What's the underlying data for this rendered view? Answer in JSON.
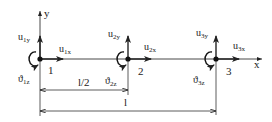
{
  "diagram": {
    "axes": {
      "x_label": "x",
      "y_label": "y"
    },
    "nodes": [
      {
        "id": "1",
        "label": "1",
        "ux": "u",
        "ux_sub": "1x",
        "uy": "u",
        "uy_sub": "1y",
        "rot": "ϑ",
        "rot_sub": "1z"
      },
      {
        "id": "2",
        "label": "2",
        "ux": "u",
        "ux_sub": "2x",
        "uy": "u",
        "uy_sub": "2y",
        "rot": "ϑ",
        "rot_sub": "2z"
      },
      {
        "id": "3",
        "label": "3",
        "ux": "u",
        "ux_sub": "3x",
        "uy": "u",
        "uy_sub": "3y",
        "rot": "ϑ",
        "rot_sub": "3z"
      }
    ],
    "dimensions": {
      "half": "l/2",
      "full": "l"
    },
    "colors": {
      "line": "#222222",
      "background": "#ffffff"
    }
  }
}
